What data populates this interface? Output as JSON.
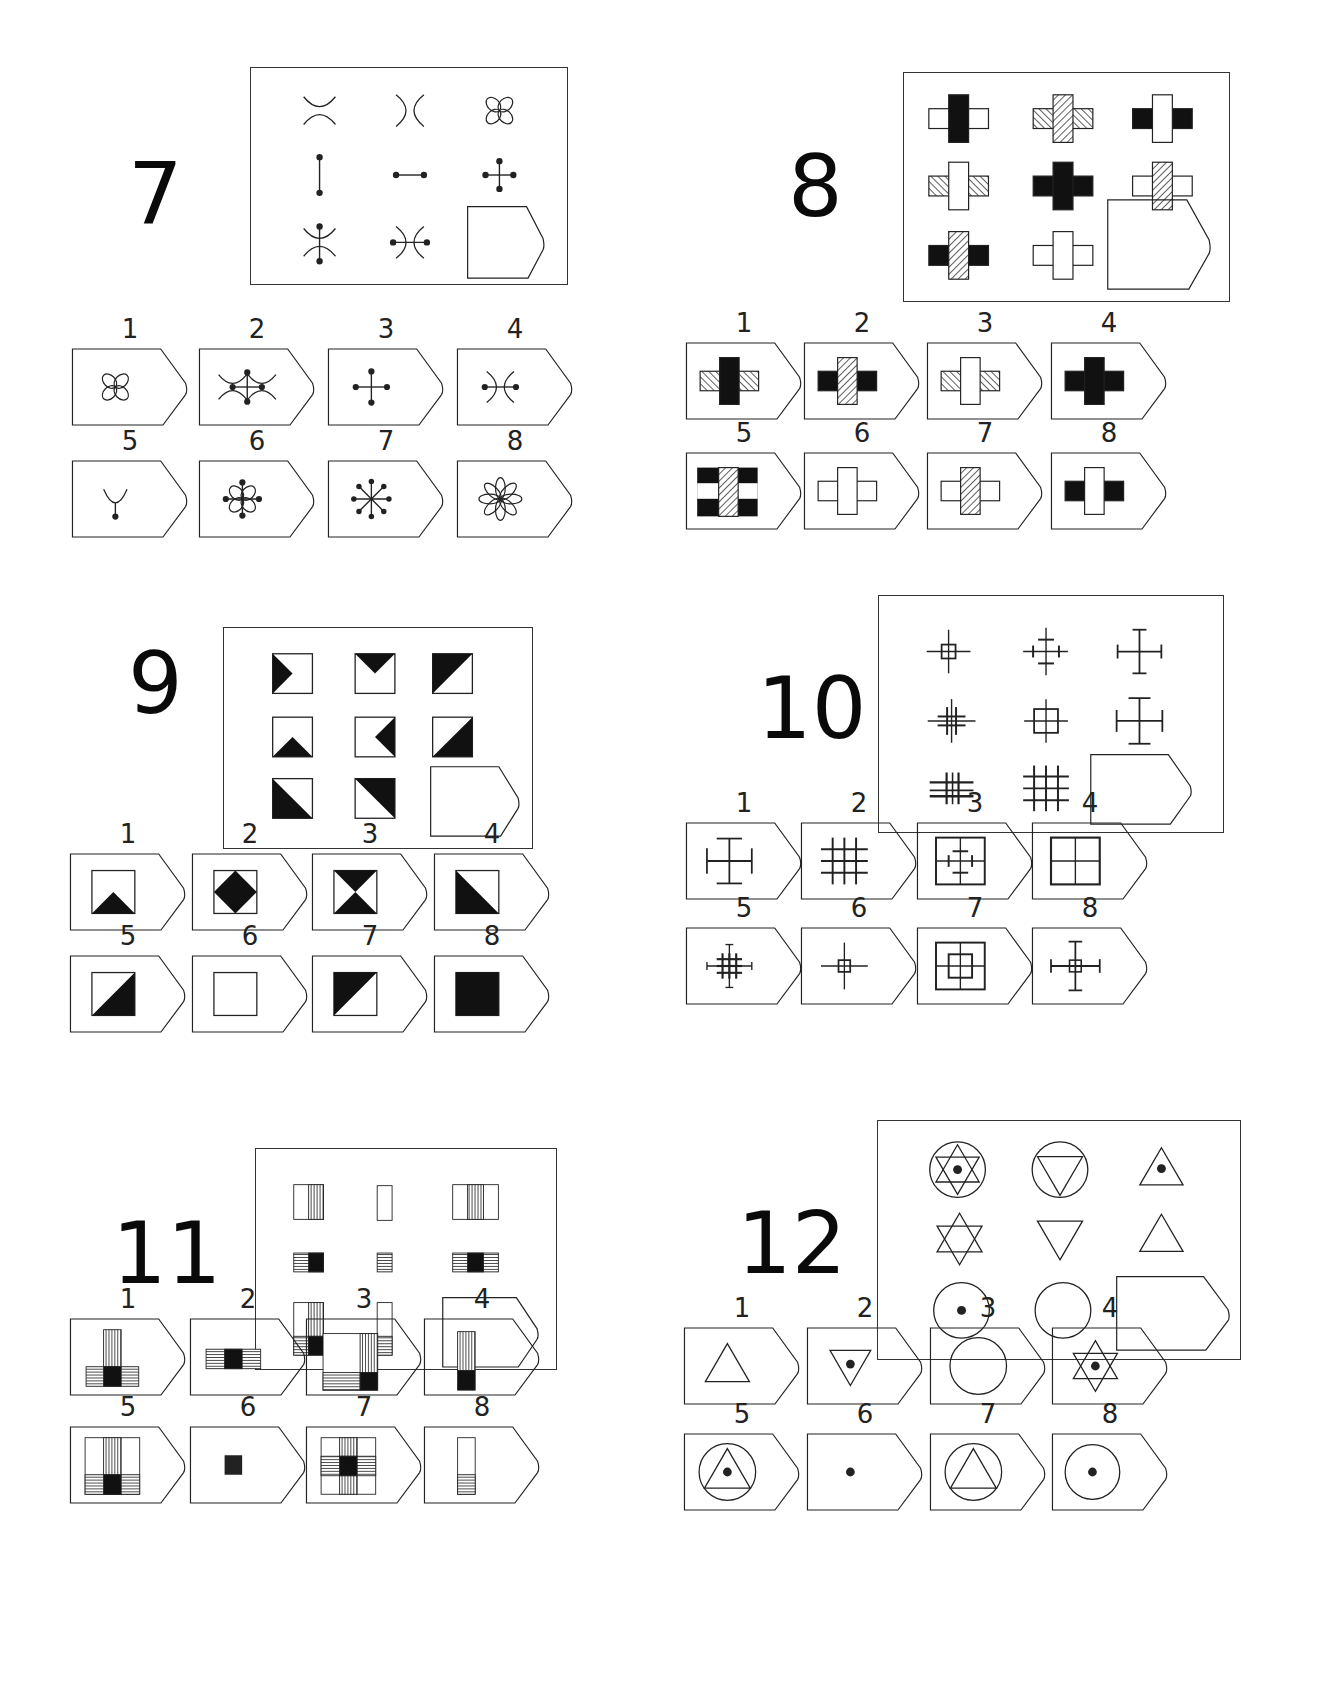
{
  "page": {
    "type": "Raven-style matrix reasoning test sheet",
    "puzzles": [
      {
        "number": "7",
        "matrix_cells": [
          "two arcs facing apart (horizontal)",
          "two arcs facing apart (vertical)",
          "four-petal flower",
          "vertical line with dots",
          "horizontal line with dots",
          "cross with four dots",
          "arcs + vertical dotted line",
          "arcs + horizontal dotted line",
          "?"
        ],
        "options": [
          {
            "label": "1",
            "desc": "four-petal flower"
          },
          {
            "label": "2",
            "desc": "arcs with cross and dots"
          },
          {
            "label": "3",
            "desc": "cross with four dots"
          },
          {
            "label": "4",
            "desc": "arcs with horizontal dotted line"
          },
          {
            "label": "5",
            "desc": "single arc with stem dot"
          },
          {
            "label": "6",
            "desc": "four-petal flower with dotted cross"
          },
          {
            "label": "7",
            "desc": "eight-spoke dotted star"
          },
          {
            "label": "8",
            "desc": "eight-petal flower"
          }
        ]
      },
      {
        "number": "8",
        "matrix_cells": [
          "white arms, black bar",
          "hatched arms, hatched bar",
          "black arms, white bar",
          "hatched arms, white bar",
          "black arms, black bar",
          "white arms, hatched bar",
          "black arms, hatched bar",
          "white arms, white bar",
          "?"
        ],
        "options": [
          {
            "label": "1",
            "desc": "hatched arms, black bar"
          },
          {
            "label": "2",
            "desc": "black arms, hatched bar"
          },
          {
            "label": "3",
            "desc": "hatched arms, white bar"
          },
          {
            "label": "4",
            "desc": "black cross"
          },
          {
            "label": "5",
            "desc": "black/white striped arms, hatched bar"
          },
          {
            "label": "6",
            "desc": "white cross"
          },
          {
            "label": "7",
            "desc": "white arms, hatched bar"
          },
          {
            "label": "8",
            "desc": "black arms, white bar"
          }
        ]
      },
      {
        "number": "9",
        "matrix_cells": [
          "left triangle",
          "top triangle",
          "top-left half",
          "bottom triangle",
          "right triangle",
          "bottom-right half",
          "bottom-left half",
          "top-right half",
          "?"
        ],
        "options": [
          {
            "label": "1",
            "desc": "bottom triangle"
          },
          {
            "label": "2",
            "desc": "diamond"
          },
          {
            "label": "3",
            "desc": "hourglass"
          },
          {
            "label": "4",
            "desc": "bottom-left half"
          },
          {
            "label": "5",
            "desc": "bottom-right half"
          },
          {
            "label": "6",
            "desc": "empty square"
          },
          {
            "label": "7",
            "desc": "top-left half"
          },
          {
            "label": "8",
            "desc": "solid square"
          }
        ]
      },
      {
        "number": "10",
        "matrix_cells": [
          "small square cross",
          "cross with short bars",
          "cross with end bars",
          "small grid cross",
          "medium square cross",
          "cross with long end bars",
          "triple grid",
          "3x3 grid",
          "?"
        ],
        "options": [
          {
            "label": "1",
            "desc": "cross with end bars"
          },
          {
            "label": "2",
            "desc": "3x3 grid"
          },
          {
            "label": "3",
            "desc": "square with inner barred cross"
          },
          {
            "label": "4",
            "desc": "square divided in four"
          },
          {
            "label": "5",
            "desc": "dense barred grid"
          },
          {
            "label": "6",
            "desc": "tiny square cross"
          },
          {
            "label": "7",
            "desc": "nested squares with cross"
          },
          {
            "label": "8",
            "desc": "small square with end bars"
          }
        ]
      },
      {
        "number": "11",
        "matrix_cells": [
          "rect with right vertical stripes",
          "narrow empty rect",
          "rect with middle vertical stripes",
          "horizontal stripes + black right",
          "small horizontal stripes",
          "horizontal stripes with black middle",
          "L composite",
          "narrow rect with bottom stripes",
          "?"
        ],
        "options": [
          {
            "label": "1",
            "desc": "T of stripes with black centre"
          },
          {
            "label": "2",
            "desc": "horizontal band with black centre"
          },
          {
            "label": "3",
            "desc": "square with right/bottom stripes"
          },
          {
            "label": "4",
            "desc": "vertical stripes with black base"
          },
          {
            "label": "5",
            "desc": "square with vertical/horizontal stripes"
          },
          {
            "label": "6",
            "desc": "black square"
          },
          {
            "label": "7",
            "desc": "square with full cross stripes"
          },
          {
            "label": "8",
            "desc": "narrow rect with bottom stripes"
          }
        ]
      },
      {
        "number": "12",
        "matrix_cells": [
          "circle + star + dot",
          "circle + inverted triangle",
          "triangle + dot",
          "star",
          "inverted triangle",
          "triangle",
          "circle + dot",
          "circle",
          "?"
        ],
        "options": [
          {
            "label": "1",
            "desc": "triangle"
          },
          {
            "label": "2",
            "desc": "inverted triangle + dot"
          },
          {
            "label": "3",
            "desc": "circle"
          },
          {
            "label": "4",
            "desc": "star + dot"
          },
          {
            "label": "5",
            "desc": "circle + triangle + dot"
          },
          {
            "label": "6",
            "desc": "dot"
          },
          {
            "label": "7",
            "desc": "circle + triangle"
          },
          {
            "label": "8",
            "desc": "circle + dot"
          }
        ]
      }
    ]
  }
}
